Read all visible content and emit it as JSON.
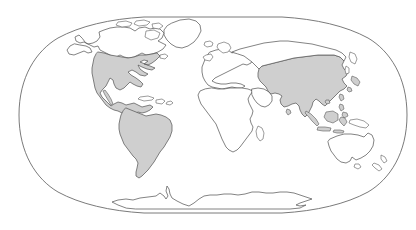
{
  "map": {
    "title": "World Map",
    "projection": "robinson-oval",
    "background_color": "#ffffff",
    "outline_color": "#5a5a5a",
    "frame_color": "#6b6b6b",
    "highlight_color": "#cfcfcf",
    "plain_color": "#ffffff",
    "canvas": {
      "width": 416,
      "height": 230
    },
    "frame": {
      "left_x": 9,
      "right_x": 407,
      "top_y": 17,
      "bottom_y": 213,
      "center_x": 208,
      "center_y": 115
    },
    "legend": {
      "highlighted_meaning": "Highlighted regions",
      "plain_meaning": "Other land"
    },
    "regions": [
      {
        "id": "north-america",
        "label": "North America",
        "highlighted": true,
        "fill": "#cfcfcf"
      },
      {
        "id": "south-america",
        "label": "South America",
        "highlighted": true,
        "fill": "#cfcfcf"
      },
      {
        "id": "asia",
        "label": "Asia",
        "highlighted": true,
        "fill": "#cfcfcf"
      },
      {
        "id": "canada-alaska",
        "label": "Canada and Alaska",
        "highlighted": false,
        "fill": "#ffffff"
      },
      {
        "id": "greenland",
        "label": "Greenland",
        "highlighted": false,
        "fill": "#ffffff"
      },
      {
        "id": "europe",
        "label": "Europe",
        "highlighted": false,
        "fill": "#ffffff"
      },
      {
        "id": "africa",
        "label": "Africa",
        "highlighted": false,
        "fill": "#ffffff"
      },
      {
        "id": "australia",
        "label": "Australia",
        "highlighted": false,
        "fill": "#ffffff"
      },
      {
        "id": "antarctica",
        "label": "Antarctica",
        "highlighted": false,
        "fill": "#ffffff"
      },
      {
        "id": "new-zealand",
        "label": "New Zealand",
        "highlighted": false,
        "fill": "#ffffff"
      },
      {
        "id": "japan",
        "label": "Japan",
        "highlighted": true,
        "fill": "#cfcfcf"
      },
      {
        "id": "indonesia",
        "label": "Indonesia",
        "highlighted": true,
        "fill": "#cfcfcf"
      },
      {
        "id": "philippines",
        "label": "Philippines",
        "highlighted": true,
        "fill": "#cfcfcf"
      },
      {
        "id": "caribbean",
        "label": "Caribbean Islands",
        "highlighted": false,
        "fill": "#ffffff"
      },
      {
        "id": "british-isles",
        "label": "British Isles",
        "highlighted": false,
        "fill": "#ffffff"
      },
      {
        "id": "madagascar",
        "label": "Madagascar",
        "highlighted": false,
        "fill": "#ffffff"
      },
      {
        "id": "iceland",
        "label": "Iceland",
        "highlighted": false,
        "fill": "#ffffff"
      },
      {
        "id": "papua-new-guinea",
        "label": "Papua New Guinea",
        "highlighted": false,
        "fill": "#ffffff"
      },
      {
        "id": "sri-lanka",
        "label": "Sri Lanka",
        "highlighted": true,
        "fill": "#cfcfcf"
      },
      {
        "id": "taiwan",
        "label": "Taiwan",
        "highlighted": true,
        "fill": "#cfcfcf"
      }
    ]
  }
}
